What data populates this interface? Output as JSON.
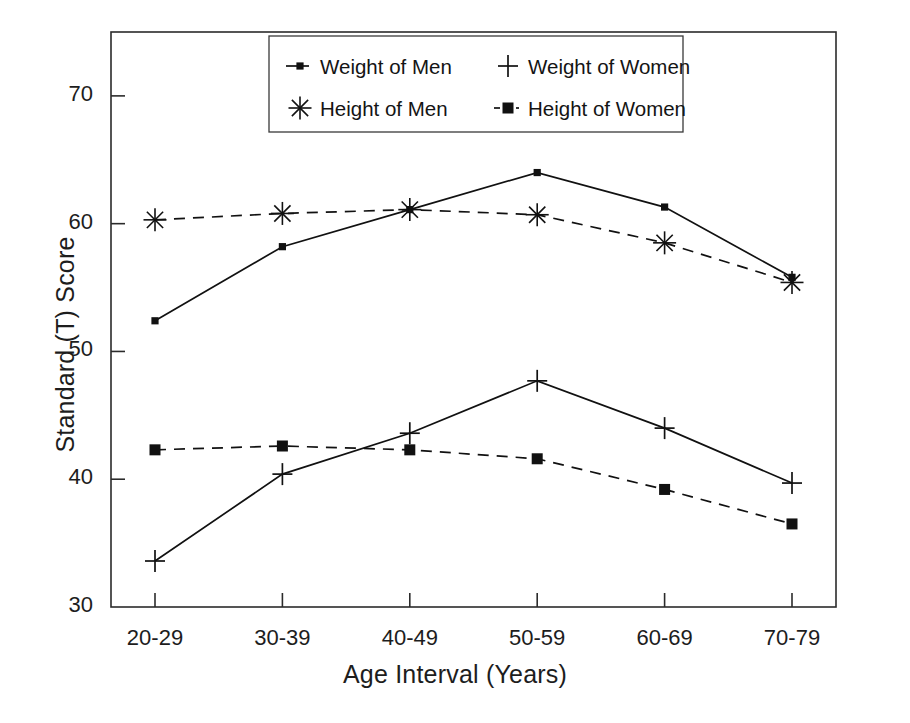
{
  "chart_data": {
    "type": "line",
    "title": "",
    "xlabel": "Age Interval (Years)",
    "ylabel": "Standard (T) Score",
    "categories": [
      "20-29",
      "30-39",
      "40-49",
      "50-59",
      "60-69",
      "70-79"
    ],
    "ylim": [
      30,
      75
    ],
    "yticks": [
      30,
      40,
      50,
      60,
      70
    ],
    "ytick_labels": [
      "30",
      "40",
      "50",
      "60",
      "70"
    ],
    "grid": false,
    "legend_position": "top-center-inside",
    "series": [
      {
        "name": "Weight of Men",
        "marker": "square-small",
        "linestyle": "solid",
        "color": "#111111",
        "values": [
          52.4,
          58.2,
          61.1,
          64.0,
          61.3,
          55.8
        ]
      },
      {
        "name": "Weight of Women",
        "marker": "plus",
        "linestyle": "solid",
        "color": "#111111",
        "values": [
          33.6,
          40.4,
          43.6,
          47.7,
          44.0,
          39.7
        ]
      },
      {
        "name": "Height of Men",
        "marker": "asterisk",
        "linestyle": "dashed",
        "color": "#111111",
        "values": [
          60.3,
          60.8,
          61.1,
          60.7,
          58.5,
          55.4
        ]
      },
      {
        "name": "Height of Women",
        "marker": "square",
        "linestyle": "dashed",
        "color": "#111111",
        "values": [
          42.3,
          42.6,
          42.3,
          41.6,
          39.2,
          36.5
        ]
      }
    ]
  },
  "legend": {
    "entries": [
      {
        "label": "Weight of Men",
        "marker": "square-small",
        "linestyle": "solid"
      },
      {
        "label": "Weight of Women",
        "marker": "plus",
        "linestyle": "none"
      },
      {
        "label": "Height of Men",
        "marker": "asterisk",
        "linestyle": "none"
      },
      {
        "label": "Height of Women",
        "marker": "square",
        "linestyle": "dotted"
      }
    ]
  },
  "axes": {
    "x_tick_labels": [
      "20-29",
      "30-39",
      "40-49",
      "50-59",
      "60-69",
      "70-79"
    ],
    "y_tick_labels": [
      "70",
      "60",
      "50",
      "40",
      "30"
    ],
    "x_title": "Age Interval (Years)",
    "y_title": "Standard (T) Score"
  },
  "style": {
    "frame_color": "#2b2b2b",
    "ink": "#111111",
    "background": "#ffffff"
  }
}
